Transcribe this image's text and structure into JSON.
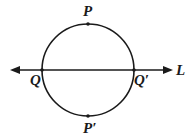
{
  "diagram": {
    "line": {
      "label": "L",
      "direction": "bidirectional"
    },
    "circle": {
      "center": [
        88,
        70
      ],
      "radius": 46
    },
    "points": [
      {
        "id": "P",
        "label": "P",
        "position": "top of circle"
      },
      {
        "id": "P_prime",
        "label": "P′",
        "position": "bottom of circle"
      },
      {
        "id": "Q",
        "label": "Q",
        "position": "left intersection of circle and line L"
      },
      {
        "id": "Q_prime",
        "label": "Q′",
        "position": "right intersection of circle and line L"
      }
    ],
    "colors": {
      "stroke": "#1a1a1a",
      "background": "#ffffff"
    }
  }
}
